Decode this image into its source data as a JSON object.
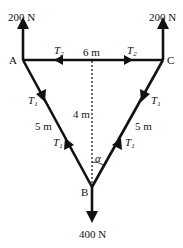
{
  "diagram": {
    "forces": {
      "left_top": "200 N",
      "right_top": "200 N",
      "bottom": "400 N"
    },
    "points": {
      "A": "A",
      "B": "B",
      "C": "C"
    },
    "dimensions": {
      "width": "6 m",
      "height": "4 m",
      "left_side": "5 m",
      "right_side": "5 m"
    },
    "tensions": {
      "T2_symbol": "T",
      "T2_sub": "2",
      "T1_symbol": "T",
      "T1_sub": "1"
    },
    "angle": "α",
    "colors": {
      "line": "#111111",
      "background": "#ffffff"
    }
  }
}
